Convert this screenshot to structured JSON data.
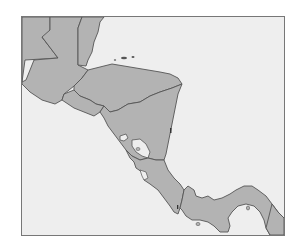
{
  "map": {
    "region": "Central America",
    "frame": {
      "x": 21,
      "y": 16,
      "width": 264,
      "height": 220
    },
    "colors": {
      "background": "#ffffff",
      "water": "#eeeeee",
      "land": "#b3b3b3",
      "border": "#555555",
      "frame": "#777777",
      "lake": "#eeeeee"
    },
    "countries": [
      {
        "name": "Guatemala",
        "id": "guatemala"
      },
      {
        "name": "Belize",
        "id": "belize"
      },
      {
        "name": "Mexico",
        "id": "mexico"
      },
      {
        "name": "Honduras",
        "id": "honduras"
      },
      {
        "name": "El Salvador",
        "id": "el-salvador"
      },
      {
        "name": "Nicaragua",
        "id": "nicaragua"
      },
      {
        "name": "Costa Rica",
        "id": "costa-rica"
      },
      {
        "name": "Panama",
        "id": "panama"
      },
      {
        "name": "Colombia",
        "id": "colombia"
      }
    ],
    "water_bodies": [
      {
        "name": "Lake Nicaragua",
        "id": "lake-nicaragua"
      },
      {
        "name": "Lake Managua",
        "id": "lake-managua"
      }
    ],
    "islands": [
      {
        "name": "Bay Islands",
        "id": "bay-islands"
      },
      {
        "name": "Isla de Coiba",
        "id": "coiba-island"
      },
      {
        "name": "Pearl Islands",
        "id": "pearl-islands"
      }
    ]
  }
}
